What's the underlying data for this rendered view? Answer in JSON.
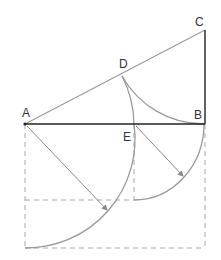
{
  "diagram": {
    "title": "",
    "points": {
      "A": {
        "label": "A",
        "x": 25,
        "y": 124,
        "label_x": 22,
        "label_y": 116
      },
      "B": {
        "label": "B",
        "x": 204,
        "y": 124,
        "label_x": 193,
        "label_y": 119
      },
      "C": {
        "label": "C",
        "x": 205,
        "y": 30,
        "label_x": 196,
        "label_y": 26
      },
      "D": {
        "label": "D",
        "x": 122,
        "y": 76,
        "label_x": 119,
        "label_y": 68
      },
      "E": {
        "label": "E",
        "x": 134,
        "y": 124,
        "label_x": 122,
        "label_y": 140
      }
    },
    "colors": {
      "solid_line": "#222222",
      "light_line": "#9a9a9a",
      "dashed_line": "#a8a8a8",
      "label": "#333333"
    }
  }
}
